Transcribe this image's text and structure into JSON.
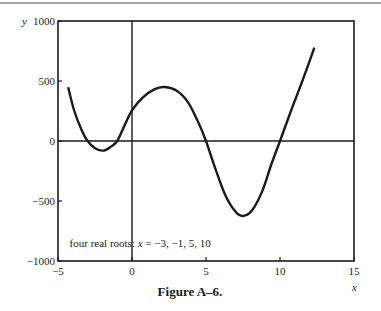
{
  "colors": {
    "ink": "#1a1a1a",
    "rule": "#555555",
    "background": "#ffffff"
  },
  "chart_data": {
    "type": "line",
    "title": "",
    "caption": "Figure A–6.",
    "xlabel": "x",
    "ylabel": "y",
    "xlim": [
      -5,
      15
    ],
    "ylim": [
      -1000,
      1000
    ],
    "xticks": [
      -5,
      0,
      5,
      10,
      15
    ],
    "xtick_labels": [
      "−5",
      "0",
      "5",
      "10",
      "15"
    ],
    "yticks": [
      -1000,
      -500,
      0,
      500,
      1000
    ],
    "ytick_labels": [
      "−1000",
      "−500",
      "0",
      "500",
      "1000"
    ],
    "grid": false,
    "reference_lines": {
      "x_zero": true,
      "y_zero": true
    },
    "annotation": {
      "text_prefix": "four real roots: ",
      "text_var": "x",
      "text_suffix": " = −3, −1, 5, 10",
      "at": [
        -3,
        -880
      ]
    },
    "series": [
      {
        "name": "quartic",
        "roots": [
          -3,
          -1,
          5,
          10
        ],
        "points": [
          [
            -4.3,
            440
          ],
          [
            -3.9,
            250
          ],
          [
            -3.4,
            90
          ],
          [
            -3.0,
            0
          ],
          [
            -2.5,
            -60
          ],
          [
            -1.9,
            -80
          ],
          [
            -1.4,
            -45
          ],
          [
            -1.0,
            0
          ],
          [
            -0.5,
            130
          ],
          [
            0.0,
            255
          ],
          [
            0.7,
            360
          ],
          [
            1.5,
            430
          ],
          [
            2.2,
            450
          ],
          [
            3.0,
            420
          ],
          [
            3.8,
            320
          ],
          [
            4.5,
            150
          ],
          [
            5.0,
            0
          ],
          [
            5.6,
            -220
          ],
          [
            6.3,
            -450
          ],
          [
            7.0,
            -590
          ],
          [
            7.5,
            -625
          ],
          [
            8.1,
            -580
          ],
          [
            8.8,
            -420
          ],
          [
            9.4,
            -200
          ],
          [
            10.0,
            0
          ],
          [
            10.8,
            270
          ],
          [
            11.6,
            530
          ],
          [
            12.3,
            770
          ]
        ]
      }
    ]
  }
}
